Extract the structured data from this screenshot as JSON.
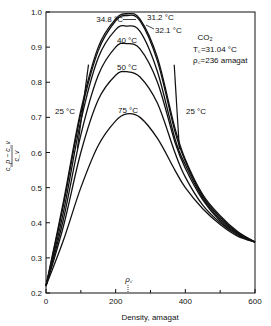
{
  "chart_data": {
    "type": "line",
    "title": "",
    "xlabel": "Density, amagat",
    "ylabel": "(c_p - c_v)/c_v",
    "xlim": [
      0,
      600
    ],
    "ylim": [
      0.2,
      1.0
    ],
    "x_ticks": [
      0,
      200,
      400,
      600
    ],
    "x_ticks_labels": [
      "0",
      "200",
      "400",
      "600"
    ],
    "x_minor_ticks": [
      100,
      300,
      500
    ],
    "y_ticks": [
      0.2,
      0.3,
      0.4,
      0.5,
      0.6,
      0.7,
      0.8,
      0.9,
      1.0
    ],
    "y_ticks_labels": [
      "0.2",
      "0.3",
      "0.4",
      "0.5",
      "0.6",
      "0.7",
      "0.8",
      "0.9",
      "1.0"
    ],
    "grid": false,
    "legend": "none",
    "annotations": {
      "substance": "CO2",
      "tc": "Tc=31.04 °C",
      "rhoc": "ρc=236 amagat",
      "rhoc_marker_label": "ρc",
      "rhoc_marker_x": 236
    },
    "series": [
      {
        "name": "31.2 °C",
        "label": "31.2 °C",
        "x": [
          0,
          50,
          100,
          150,
          200,
          232,
          270,
          320,
          370,
          400,
          450,
          500,
          550,
          600
        ],
        "values": [
          0.22,
          0.46,
          0.72,
          0.9,
          0.98,
          0.995,
          0.98,
          0.87,
          0.67,
          0.58,
          0.48,
          0.42,
          0.375,
          0.345
        ]
      },
      {
        "name": "32.1 °C",
        "label": "32.1 °C",
        "x": [
          0,
          50,
          100,
          150,
          200,
          232,
          270,
          320,
          370,
          400,
          450,
          500,
          550,
          600
        ],
        "values": [
          0.22,
          0.45,
          0.71,
          0.89,
          0.975,
          0.99,
          0.975,
          0.86,
          0.66,
          0.575,
          0.475,
          0.415,
          0.372,
          0.345
        ]
      },
      {
        "name": "34.8 °C",
        "label": "34.8 °C",
        "x": [
          0,
          50,
          100,
          150,
          200,
          232,
          270,
          320,
          370,
          400,
          450,
          500,
          550,
          600
        ],
        "values": [
          0.22,
          0.43,
          0.69,
          0.87,
          0.95,
          0.96,
          0.945,
          0.83,
          0.64,
          0.565,
          0.47,
          0.41,
          0.37,
          0.345
        ]
      },
      {
        "name": "40 °C",
        "label": "40 °C",
        "x": [
          0,
          50,
          100,
          150,
          200,
          232,
          270,
          320,
          370,
          400,
          450,
          500,
          550,
          600
        ],
        "values": [
          0.22,
          0.41,
          0.65,
          0.82,
          0.9,
          0.91,
          0.895,
          0.8,
          0.63,
          0.555,
          0.465,
          0.405,
          0.368,
          0.345
        ]
      },
      {
        "name": "50 °C",
        "label": "50 °C",
        "x": [
          0,
          50,
          100,
          150,
          200,
          232,
          270,
          320,
          370,
          400,
          450,
          500,
          550,
          600
        ],
        "values": [
          0.22,
          0.39,
          0.6,
          0.75,
          0.82,
          0.83,
          0.815,
          0.74,
          0.6,
          0.53,
          0.45,
          0.4,
          0.365,
          0.345
        ]
      },
      {
        "name": "75 °C",
        "label": "75 °C",
        "x": [
          0,
          50,
          100,
          150,
          200,
          232,
          270,
          320,
          370,
          400,
          450,
          500,
          550,
          600
        ],
        "values": [
          0.22,
          0.35,
          0.5,
          0.62,
          0.69,
          0.71,
          0.7,
          0.64,
          0.55,
          0.5,
          0.44,
          0.395,
          0.362,
          0.345
        ]
      }
    ],
    "isolated_segments": [
      {
        "name": "25 °C (gas branch)",
        "label": "25 °C",
        "x": [
          90,
          122
        ],
        "values": [
          0.61,
          0.85
        ]
      },
      {
        "name": "25 °C (liquid branch)",
        "label": "25 °C",
        "x": [
          368,
          383
        ],
        "values": [
          0.85,
          0.61
        ]
      }
    ]
  },
  "labels": {
    "xlabel": "Density, amagat",
    "ylabel_num": "c_p − c_v",
    "ylabel_den": "c_v",
    "co2": "CO₂",
    "tc": "T꜀=31.04 °C",
    "rhoc": "ρ꜀=236 amagat",
    "rhoc_marker": "ρ꜀",
    "t312": "31.2 °C",
    "t321": "32.1 °C",
    "t348": "34.8 °C",
    "t40": "40 °C",
    "t50": "50 °C",
    "t75": "75 °C",
    "t25_left": "25 °C",
    "t25_right": "25 °C"
  }
}
